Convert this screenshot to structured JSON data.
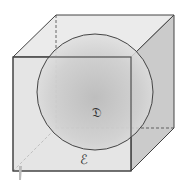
{
  "diagram": {
    "type": "sphere-inscribed-in-cube",
    "labels": {
      "sphere": "𝔇",
      "cube": "ℰ"
    },
    "colors": {
      "edge": "#444444",
      "front_face": "#d8d8d8",
      "side_face": "#c4c4c4",
      "top_face": "#e6e6e6",
      "sphere_center": "#bdbdbd",
      "sphere_edge": "#e2e2e2"
    }
  }
}
